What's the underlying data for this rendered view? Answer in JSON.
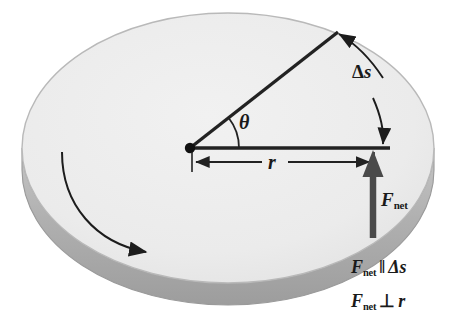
{
  "figure": {
    "labels": {
      "theta": "θ",
      "radius": "r",
      "arc_length_delta": "Δ",
      "arc_length_var": "s",
      "force_symbol": "F",
      "force_subscript": "net"
    },
    "equations": [
      {
        "id": "parallel",
        "lhs_symbol": "F",
        "lhs_subscript": "net",
        "operator": "‖",
        "rhs": "Δs"
      },
      {
        "id": "perpendicular",
        "lhs_symbol": "F",
        "lhs_subscript": "net",
        "operator": "⊥",
        "rhs": "r"
      }
    ],
    "colors": {
      "disk_top": "#eeeeee",
      "disk_edge_stroke": "#b9b9b9",
      "disk_side": "#b4b4b4",
      "disk_side_dark": "#a0a0a0",
      "line": "#222222",
      "force_arrow": "#4a4a4a",
      "text": "#1a1a1a",
      "background": "#ffffff"
    },
    "geometry": {
      "disk_center_x": 228,
      "disk_center_y": 148,
      "disk_radius_x": 206,
      "disk_radius_y": 135,
      "disk_thickness": 26,
      "pivot_x": 190,
      "pivot_y": 148,
      "radius_end_x": 375,
      "radius_end_y": 148,
      "angle_degrees": 38
    }
  }
}
